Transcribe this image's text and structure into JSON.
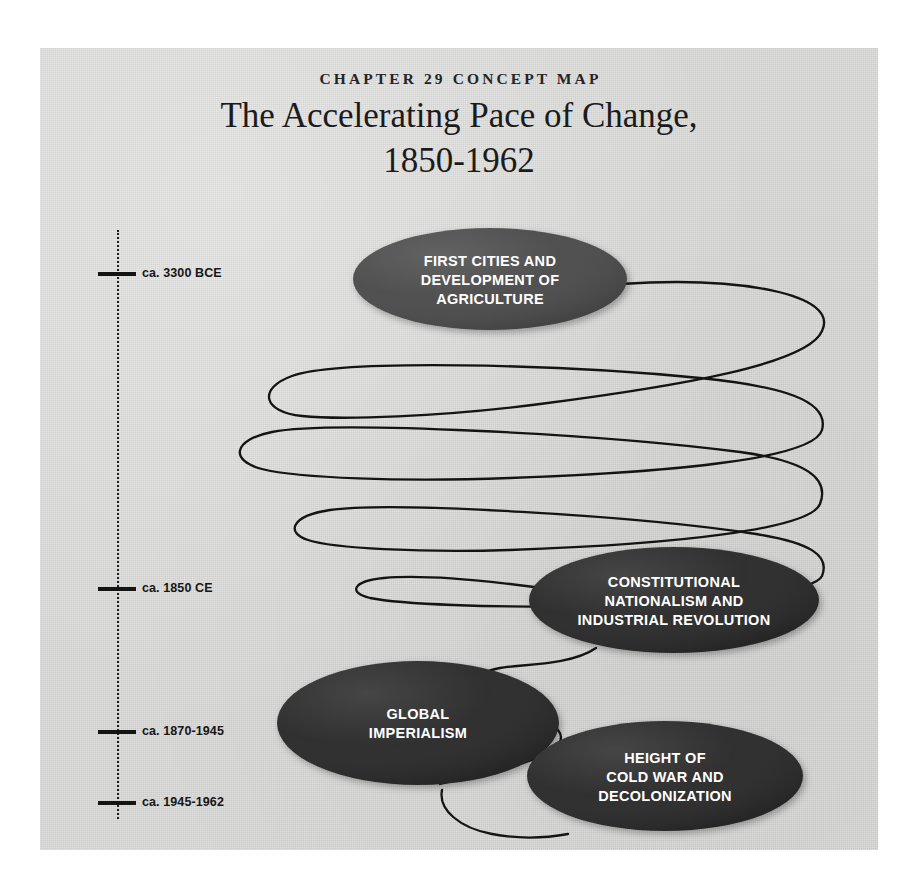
{
  "figure": {
    "kicker": "CHAPTER 29 CONCEPT MAP",
    "title": "The Accelerating Pace of Change,\n1850-1962",
    "paper_color": "#d4d4d2",
    "line_color": "#141414"
  },
  "timeline": {
    "axis_style": "dotted",
    "entries": [
      {
        "label": "ca. 3300 BCE",
        "y": 66
      },
      {
        "label": "ca. 1850 CE",
        "y": 381
      },
      {
        "label": "ca. 1870-1945",
        "y": 524
      },
      {
        "label": "ca. 1945-1962",
        "y": 595
      }
    ]
  },
  "nodes": [
    {
      "id": "first-cities",
      "label": "FIRST CITIES AND\nDEVELOPMENT OF\nAGRICULTURE",
      "lines": [
        "FIRST CITIES AND",
        "DEVELOPMENT OF",
        "AGRICULTURE"
      ],
      "cx": 450,
      "cy": 231,
      "rx": 137,
      "ry": 51,
      "fill": "#4c4c4c"
    },
    {
      "id": "constitutional-nationalism",
      "label": "CONSTITUTIONAL\nNATIONALISM AND\nINDUSTRIAL REVOLUTION",
      "lines": [
        "CONSTITUTIONAL",
        "NATIONALISM AND",
        "INDUSTRIAL REVOLUTION"
      ],
      "cx": 634,
      "cy": 552,
      "rx": 145,
      "ry": 53,
      "fill": "#2b2b2b"
    },
    {
      "id": "global-imperialism",
      "label": "GLOBAL\nIMPERIALISM",
      "lines": [
        "GLOBAL",
        "IMPERIALISM"
      ],
      "cx": 378,
      "cy": 675,
      "rx": 141,
      "ry": 62,
      "fill": "#2b2b2b"
    },
    {
      "id": "cold-war",
      "label": "HEIGHT OF\nCOLD WAR AND\nDECOLONIZATION",
      "lines": [
        "HEIGHT OF",
        "COLD WAR AND",
        "DECOLONIZATION"
      ],
      "cx": 625,
      "cy": 728,
      "rx": 138,
      "ry": 55,
      "fill": "#2b2b2b"
    }
  ],
  "connector": {
    "description": "Serpentine switchback line from first node, looping back and forth with decreasing amplitude, into the later nodes",
    "stroke": "#141414",
    "stroke_width": 2.3
  },
  "chart_data": {
    "type": "diagram",
    "title": "The Accelerating Pace of Change, 1850-1962",
    "subtitle": "CHAPTER 29 CONCEPT MAP",
    "axis_labels": [
      "ca. 3300 BCE",
      "ca. 1850 CE",
      "ca. 1870-1945",
      "ca. 1945-1962"
    ],
    "node_labels": [
      "FIRST CITIES AND DEVELOPMENT OF AGRICULTURE",
      "CONSTITUTIONAL NATIONALISM AND INDUSTRIAL REVOLUTION",
      "GLOBAL IMPERIALISM",
      "HEIGHT OF COLD WAR AND DECOLONIZATION"
    ],
    "flow": [
      "FIRST CITIES AND DEVELOPMENT OF AGRICULTURE",
      "CONSTITUTIONAL NATIONALISM AND INDUSTRIAL REVOLUTION",
      "GLOBAL IMPERIALISM",
      "HEIGHT OF COLD WAR AND DECOLONIZATION"
    ],
    "grid": false,
    "legend": "none"
  }
}
